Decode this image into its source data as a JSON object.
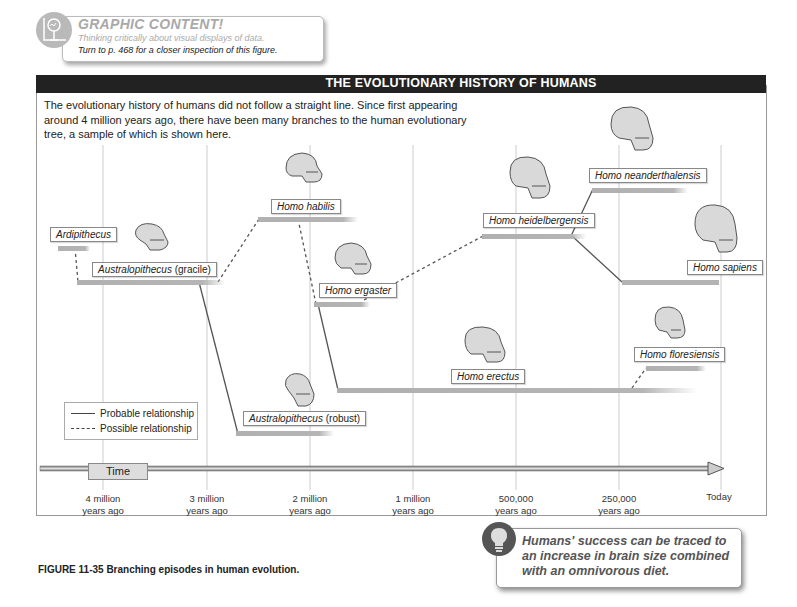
{
  "callout": {
    "title": "GRAPHIC CONTENT!",
    "subtitle": "Thinking critically about visual displays of data.",
    "turn_to": "Turn to p. 468 for a closer inspection of this figure.",
    "icon": "chart-magnifier-icon"
  },
  "figure": {
    "header_title": "THE EVOLUTIONARY HISTORY OF HUMANS",
    "intro_text": "The evolutionary history of humans did not follow a straight line. Since first appearing around 4 million years ago, there have been many branches to the human evolutionary tree, a sample of which is shown here.",
    "legend": {
      "probable": "Probable relationship",
      "possible": "Possible relationship"
    },
    "time_label": "Time",
    "time_ticks": [
      {
        "line1": "4 million",
        "line2": "years ago"
      },
      {
        "line1": "3 million",
        "line2": "years ago"
      },
      {
        "line1": "2 million",
        "line2": "years ago"
      },
      {
        "line1": "1 million",
        "line2": "years ago"
      },
      {
        "line1": "500,000",
        "line2": "years ago"
      },
      {
        "line1": "250,000",
        "line2": "years ago"
      },
      {
        "line1": "Today",
        "line2": ""
      }
    ],
    "species": [
      {
        "id": "ardipithecus",
        "genus": "Ardipithecus",
        "qualifier": ""
      },
      {
        "id": "australopithecus-gracile",
        "genus": "Australopithecus",
        "qualifier": "(gracile)"
      },
      {
        "id": "homo-habilis",
        "genus": "Homo habilis",
        "qualifier": ""
      },
      {
        "id": "australopithecus-robust",
        "genus": "Australopithecus",
        "qualifier": "(robust)"
      },
      {
        "id": "homo-ergaster",
        "genus": "Homo ergaster",
        "qualifier": ""
      },
      {
        "id": "homo-erectus",
        "genus": "Homo erectus",
        "qualifier": ""
      },
      {
        "id": "homo-heidelbergensis",
        "genus": "Homo heidelbergensis",
        "qualifier": ""
      },
      {
        "id": "homo-neanderthalensis",
        "genus": "Homo neanderthalensis",
        "qualifier": ""
      },
      {
        "id": "homo-sapiens",
        "genus": "Homo sapiens",
        "qualifier": ""
      },
      {
        "id": "homo-floresiensis",
        "genus": "Homo floresiensis",
        "qualifier": ""
      }
    ],
    "relationships": [
      {
        "from": "Ardipithecus",
        "to": "Australopithecus (gracile)",
        "type": "possible"
      },
      {
        "from": "Australopithecus (gracile)",
        "to": "Homo habilis",
        "type": "possible"
      },
      {
        "from": "Australopithecus (gracile)",
        "to": "Australopithecus (robust)",
        "type": "probable"
      },
      {
        "from": "Homo habilis",
        "to": "Homo ergaster",
        "type": "possible"
      },
      {
        "from": "Homo ergaster",
        "to": "Homo erectus",
        "type": "probable"
      },
      {
        "from": "Homo ergaster",
        "to": "Homo heidelbergensis",
        "type": "possible"
      },
      {
        "from": "Homo heidelbergensis",
        "to": "Homo neanderthalensis",
        "type": "probable"
      },
      {
        "from": "Homo heidelbergensis",
        "to": "Homo sapiens",
        "type": "probable"
      },
      {
        "from": "Homo erectus",
        "to": "Homo floresiensis",
        "type": "possible"
      }
    ],
    "caption_number": "FIGURE 11-35",
    "caption_text": "Branching episodes in human evolution."
  },
  "tip": {
    "text": "Humans' success can be traced to an increase in brain size combined with an omnivorous diet.",
    "icon": "lightbulb-icon"
  },
  "colors": {
    "header_bg": "#222222",
    "bar": "#b3b3b3",
    "line": "#555555",
    "callout_title": "#a9a9a9"
  }
}
